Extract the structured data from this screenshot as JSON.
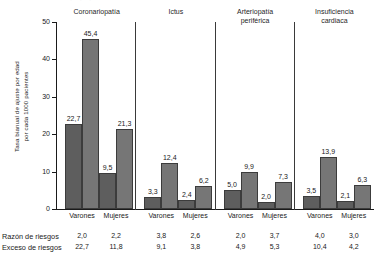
{
  "axis": {
    "y_title_line1": "Tasa bianual de ajuste por edad",
    "y_title_line2": "por cada 1000 pacientes",
    "y_ticks": [
      "50",
      "40",
      "30",
      "20",
      "10",
      "0"
    ]
  },
  "rows": {
    "ratio_label": "Razón de riesgos",
    "excess_label": "Exceso de riesgos"
  },
  "groups": [
    {
      "header_line1": "Coronariopatía",
      "header_line2": "",
      "bars": [
        {
          "sex": "Varones",
          "value": "22,7",
          "ratio": "2,0",
          "excess": "22,7"
        },
        {
          "sex": "",
          "value": "45,4",
          "ratio": "",
          "excess": ""
        },
        {
          "sex": "Mujeres",
          "value": "9,5",
          "ratio": "2,2",
          "excess": "11,8"
        },
        {
          "sex": "",
          "value": "21,3",
          "ratio": "",
          "excess": ""
        }
      ]
    },
    {
      "header_line1": "Ictus",
      "header_line2": "",
      "bars": [
        {
          "sex": "Varones",
          "value": "3,3",
          "ratio": "3,8",
          "excess": "9,1"
        },
        {
          "sex": "",
          "value": "12,4",
          "ratio": "",
          "excess": ""
        },
        {
          "sex": "Mujeres",
          "value": "2,4",
          "ratio": "2,6",
          "excess": "3,8"
        },
        {
          "sex": "",
          "value": "6,2",
          "ratio": "",
          "excess": ""
        }
      ]
    },
    {
      "header_line1": "Arteriopatía",
      "header_line2": "periférica",
      "bars": [
        {
          "sex": "Varones",
          "value": "5,0",
          "ratio": "2,0",
          "excess": "4,9"
        },
        {
          "sex": "",
          "value": "9,9",
          "ratio": "",
          "excess": ""
        },
        {
          "sex": "Mujeres",
          "value": "2,0",
          "ratio": "3,7",
          "excess": "5,3"
        },
        {
          "sex": "",
          "value": "7,3",
          "ratio": "",
          "excess": ""
        }
      ]
    },
    {
      "header_line1": "Insuficiencia",
      "header_line2": "cardiaca",
      "bars": [
        {
          "sex": "Varones",
          "value": "3,5",
          "ratio": "4,0",
          "excess": "10,4"
        },
        {
          "sex": "",
          "value": "13,9",
          "ratio": "",
          "excess": ""
        },
        {
          "sex": "Mujeres",
          "value": "2,1",
          "ratio": "3,0",
          "excess": "4,2"
        },
        {
          "sex": "",
          "value": "6,3",
          "ratio": "",
          "excess": ""
        }
      ]
    }
  ],
  "chart_data": {
    "type": "bar",
    "title": "",
    "xlabel": "",
    "ylabel": "Tasa bianual de ajuste por edad por cada 1000 pacientes",
    "ylim": [
      0,
      50
    ],
    "yticks": [
      0,
      10,
      20,
      30,
      40,
      50
    ],
    "grid": false,
    "legend": "none",
    "bar_color": "#6b6b6b",
    "groups": [
      "Coronariopatía",
      "Ictus",
      "Arteriopatía periférica",
      "Insuficiencia cardiaca"
    ],
    "subgroups": [
      "Varones",
      "Mujeres"
    ],
    "values": [
      {
        "group": "Coronariopatía",
        "sex": "Varones",
        "bars": [
          22.7,
          45.4
        ],
        "razon_de_riesgos": 2.0,
        "exceso_de_riesgos": 22.7
      },
      {
        "group": "Coronariopatía",
        "sex": "Mujeres",
        "bars": [
          9.5,
          21.3
        ],
        "razon_de_riesgos": 2.2,
        "exceso_de_riesgos": 11.8
      },
      {
        "group": "Ictus",
        "sex": "Varones",
        "bars": [
          3.3,
          12.4
        ],
        "razon_de_riesgos": 3.8,
        "exceso_de_riesgos": 9.1
      },
      {
        "group": "Ictus",
        "sex": "Mujeres",
        "bars": [
          2.4,
          6.2
        ],
        "razon_de_riesgos": 2.6,
        "exceso_de_riesgos": 3.8
      },
      {
        "group": "Arteriopatía periférica",
        "sex": "Varones",
        "bars": [
          5.0,
          9.9
        ],
        "razon_de_riesgos": 2.0,
        "exceso_de_riesgos": 4.9
      },
      {
        "group": "Arteriopatía periférica",
        "sex": "Mujeres",
        "bars": [
          2.0,
          7.3
        ],
        "razon_de_riesgos": 3.7,
        "exceso_de_riesgos": 5.3
      },
      {
        "group": "Insuficiencia cardiaca",
        "sex": "Varones",
        "bars": [
          3.5,
          13.9
        ],
        "razon_de_riesgos": 4.0,
        "exceso_de_riesgos": 10.4
      },
      {
        "group": "Insuficiencia cardiaca",
        "sex": "Mujeres",
        "bars": [
          2.1,
          6.3
        ],
        "razon_de_riesgos": 3.0,
        "exceso_de_riesgos": 4.2
      }
    ],
    "annotation_rows": [
      {
        "label": "Razón de riesgos",
        "values": [
          2.0,
          2.2,
          3.8,
          2.6,
          2.0,
          3.7,
          4.0,
          3.0
        ]
      },
      {
        "label": "Exceso de riesgos",
        "values": [
          22.7,
          11.8,
          9.1,
          3.8,
          4.9,
          5.3,
          10.4,
          4.2
        ]
      }
    ]
  }
}
